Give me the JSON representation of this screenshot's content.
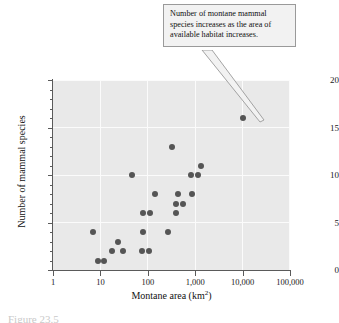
{
  "figure": {
    "caption": "Figure 23.5"
  },
  "annotation": {
    "text": "Number of montane mammal species increases as the area of available habitat increases.",
    "target_point": {
      "x": 10000,
      "y": 16
    }
  },
  "colors": {
    "plot_background": "#e9e9e9",
    "gridline": "#fbfbfb",
    "marker": "#555555",
    "axis": "#5a5a5a",
    "callout_background": "#f2f2f2",
    "callout_border": "#9a9a9a"
  },
  "chart_data": {
    "type": "scatter",
    "title": "",
    "xlabel": "Montane area (km2)",
    "xlabel_base": "Montane area (km",
    "xlabel_sup": "2",
    "xlabel_tail": ")",
    "ylabel": "Number of mammal species",
    "xscale": "log",
    "yscale": "linear",
    "xlim": [
      1,
      100000
    ],
    "ylim": [
      0,
      20
    ],
    "xticks": [
      1,
      10,
      100,
      1000,
      10000,
      100000
    ],
    "xticklabels": [
      "1",
      "10",
      "100",
      "1,000",
      "10,000",
      "100,000"
    ],
    "yticks": [
      0,
      5,
      10,
      15,
      20
    ],
    "yticklabels": [
      "0",
      "5",
      "10",
      "15",
      "20"
    ],
    "yminorticks": [
      1,
      2,
      3,
      4,
      6,
      7,
      8,
      9,
      11,
      12,
      13,
      14,
      16,
      17,
      18,
      19
    ],
    "grid": true,
    "legend": null,
    "points": [
      {
        "x": 7,
        "y": 4
      },
      {
        "x": 9,
        "y": 1
      },
      {
        "x": 12,
        "y": 1
      },
      {
        "x": 18,
        "y": 2
      },
      {
        "x": 23,
        "y": 3
      },
      {
        "x": 30,
        "y": 2
      },
      {
        "x": 46,
        "y": 10
      },
      {
        "x": 75,
        "y": 2
      },
      {
        "x": 78,
        "y": 6
      },
      {
        "x": 80,
        "y": 4
      },
      {
        "x": 105,
        "y": 2
      },
      {
        "x": 110,
        "y": 6
      },
      {
        "x": 140,
        "y": 8
      },
      {
        "x": 270,
        "y": 4
      },
      {
        "x": 330,
        "y": 13
      },
      {
        "x": 390,
        "y": 7
      },
      {
        "x": 400,
        "y": 6
      },
      {
        "x": 430,
        "y": 8
      },
      {
        "x": 560,
        "y": 7
      },
      {
        "x": 820,
        "y": 10
      },
      {
        "x": 870,
        "y": 8
      },
      {
        "x": 1150,
        "y": 10
      },
      {
        "x": 1300,
        "y": 11
      },
      {
        "x": 10000,
        "y": 16
      }
    ]
  }
}
